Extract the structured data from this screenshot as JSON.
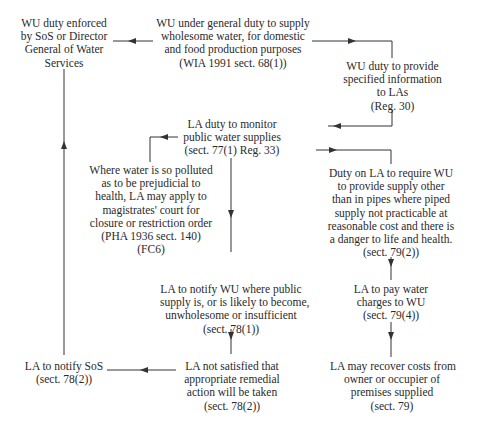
{
  "diagram": {
    "nodes": {
      "wu_enforced": {
        "lines": [
          "WU duty enforced",
          "by SoS or Director",
          "General of Water",
          "Services"
        ]
      },
      "wu_general_duty": {
        "lines": [
          "WU under general duty to supply",
          "wholesome water, for domestic",
          "and food production purposes",
          "(WIA 1991 sect. 68(1))"
        ]
      },
      "wu_provide_info": {
        "lines": [
          "WU duty to provide",
          "specified information",
          "to LAs",
          "(Reg. 30)"
        ]
      },
      "la_monitor": {
        "lines": [
          "LA duty to monitor",
          "public water supplies",
          "(sect. 77(1) Reg. 33)"
        ]
      },
      "polluted_court": {
        "lines": [
          "Where water is so polluted",
          "as to be prejudicial to",
          "health, LA may apply to",
          "magistrates' court for",
          "closure or restriction order",
          "(PHA 1936 sect. 140)",
          "(FC6)"
        ]
      },
      "la_require_supply": {
        "lines": [
          "Duty on LA to require WU",
          "to provide supply other",
          "than in pipes where piped",
          "supply not practicable at",
          "reasonable cost and there is",
          "a danger to life and health.",
          "(sect. 79(2))"
        ]
      },
      "la_notify_wu": {
        "lines": [
          "LA to notify WU where public",
          "supply is, or is likely to become,",
          "unwholesome or insufficient",
          "(sect. 78(1))"
        ]
      },
      "la_pay_charges": {
        "lines": [
          "LA to pay water",
          "charges to WU",
          "(sect. 79(4))"
        ]
      },
      "la_notify_sos": {
        "lines": [
          "LA to notify SoS",
          "(sect. 78(2))"
        ]
      },
      "la_not_satisfied": {
        "lines": [
          "LA not satisfied that",
          "appropriate remedial",
          "action will be taken",
          "(sect. 78(2))"
        ]
      },
      "la_recover_costs": {
        "lines": [
          "LA may recover costs from",
          "owner or occupier of",
          "premises supplied",
          "(sect. 79)"
        ]
      }
    },
    "edges": [
      {
        "from": "wu_general_duty",
        "to": "wu_enforced"
      },
      {
        "from": "wu_general_duty",
        "to": "wu_provide_info"
      },
      {
        "from": "wu_provide_info",
        "to": "la_monitor"
      },
      {
        "from": "la_monitor",
        "to": "polluted_court"
      },
      {
        "from": "la_monitor",
        "to": "la_require_supply"
      },
      {
        "from": "la_monitor",
        "to": "la_notify_wu"
      },
      {
        "from": "la_require_supply",
        "to": "la_pay_charges"
      },
      {
        "from": "la_pay_charges",
        "to": "la_recover_costs"
      },
      {
        "from": "la_notify_wu",
        "to": "la_not_satisfied"
      },
      {
        "from": "la_not_satisfied",
        "to": "la_notify_sos"
      },
      {
        "from": "la_notify_sos",
        "to": "wu_enforced"
      }
    ],
    "colors": {
      "stroke": "#333333",
      "text": "#2a2a2a",
      "background": "#ffffff"
    }
  }
}
